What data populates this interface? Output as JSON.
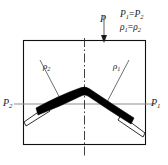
{
  "figure": {
    "type": "engineering-cross-section-diagram",
    "canvas": {
      "width": 168,
      "height": 165
    },
    "frame": {
      "name": "specimen-outline",
      "x": 23,
      "y": 40,
      "width": 123,
      "height": 105,
      "stroke_color": "#111111",
      "stroke_width": 1.1
    },
    "centerline": {
      "name": "vertical-axis-of-symmetry",
      "x": 84.5,
      "y_top": 40,
      "y_bottom": 156,
      "style": "dash-dot",
      "color": "#2b2b2b"
    },
    "horizontal_axis": {
      "name": "pressure-axis",
      "x_start": 14,
      "x_end": 156,
      "y": 104,
      "color": "#8e8e8e",
      "stroke_width": 1
    },
    "load_arrow": {
      "name": "applied-load-arrow",
      "x": 104,
      "y_start": 16,
      "y_end": 42,
      "color": "#6d6d6d",
      "head_color": "#1c1c1c"
    },
    "chevron": {
      "name": "deformed-band",
      "apex_x": 84.5,
      "apex_y": 89,
      "left_end_x": 36,
      "left_end_y": 110,
      "right_end_x": 133,
      "right_end_y": 121,
      "band_thickness": 6.5,
      "fill_color": "#000000"
    },
    "wedges": [
      {
        "name": "left-wedge",
        "tip_x": 25,
        "tip_y": 119,
        "base_x": 44,
        "base_y": 108
      },
      {
        "name": "right-wedge",
        "tip_x": 145,
        "tip_y": 130,
        "base_x": 124,
        "base_y": 117
      }
    ],
    "leader_lines": [
      {
        "name": "leader-rho2",
        "x1": 40,
        "y1": 60,
        "x2": 62,
        "y2": 103
      },
      {
        "name": "leader-rho1",
        "x1": 128,
        "y1": 60,
        "x2": 106,
        "y2": 103
      }
    ]
  },
  "labels": {
    "load": {
      "symbol": "P",
      "subscript": ""
    },
    "pressure_left": {
      "symbol": "P",
      "subscript": "2"
    },
    "pressure_right": {
      "symbol": "P",
      "subscript": "1"
    },
    "density_left": {
      "symbol": "ρ",
      "subscript": "2"
    },
    "density_right": {
      "symbol": "ρ",
      "subscript": "1"
    },
    "equation_pressure": {
      "lhs_symbol": "P",
      "lhs_subscript": "1",
      "operator": "=",
      "rhs_symbol": "P",
      "rhs_subscript": "2",
      "text": "P1=P2"
    },
    "equation_density": {
      "lhs_symbol": "ρ",
      "lhs_subscript": "1",
      "operator": "=",
      "rhs_symbol": "ρ",
      "rhs_subscript": "2",
      "text": "ρ1=ρ2"
    }
  },
  "colors": {
    "outline": "#111111",
    "band": "#000000",
    "axis_gray": "#8e8e8e",
    "centerline": "#2b2b2b",
    "arrow_shaft": "#6d6d6d",
    "text": "#1a1a1a",
    "background": "#ffffff"
  }
}
